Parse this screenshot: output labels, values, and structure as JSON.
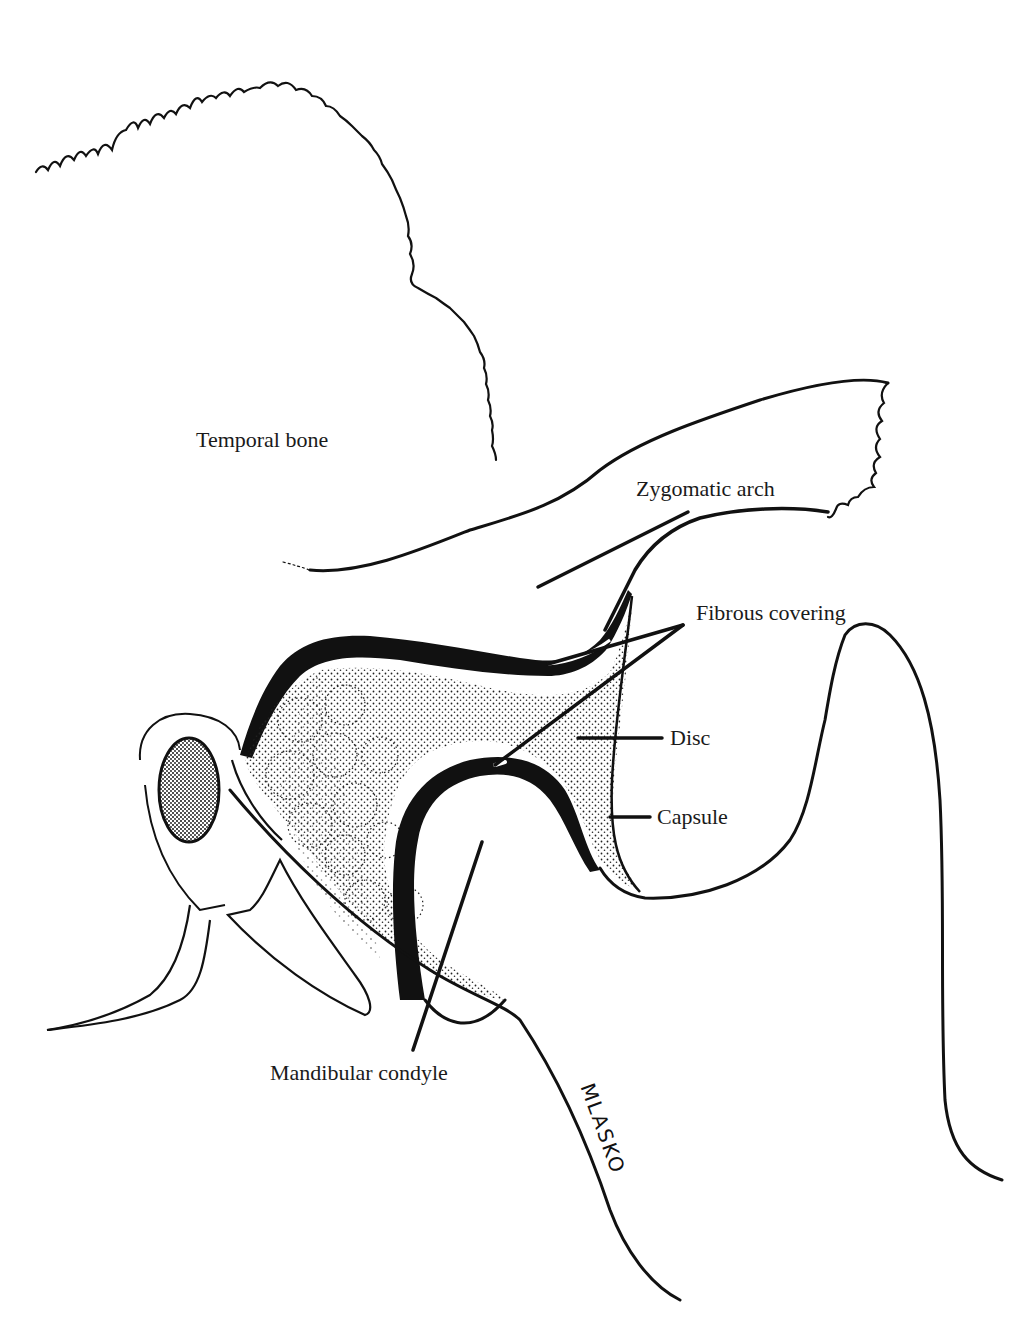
{
  "diagram": {
    "labels": {
      "temporal_bone": "Temporal bone",
      "zygomatic_arch": "Zygomatic arch",
      "fibrous_covering": "Fibrous covering",
      "disc": "Disc",
      "capsule": "Capsule",
      "mandibular_condyle": "Mandibular condyle"
    },
    "signature": "MLASKO",
    "colors": {
      "ink": "#111111",
      "background": "#ffffff",
      "stipple": "#1a1a1a"
    }
  }
}
